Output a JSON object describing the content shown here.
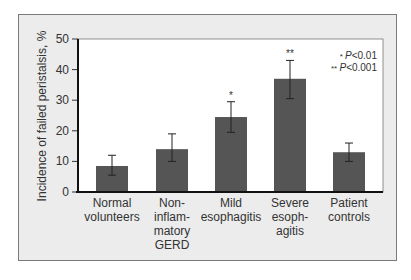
{
  "chart_data": {
    "type": "bar",
    "title": "",
    "xlabel": "",
    "ylabel": "Incidence of failed peristalsis, %",
    "ylim": [
      0,
      50
    ],
    "yticks": [
      0,
      10,
      20,
      30,
      40,
      50
    ],
    "grid": false,
    "categories": [
      "Normal volunteers",
      "Non-inflammatory GERD",
      "Mild esophagitis",
      "Severe esophagitis",
      "Patient controls"
    ],
    "category_label_lines": [
      [
        "Normal",
        "volunteers"
      ],
      [
        "Non-",
        "inflam-",
        "matory",
        "GERD"
      ],
      [
        "Mild",
        "esophagitis"
      ],
      [
        "Severe",
        "esoph-",
        "agitis"
      ],
      [
        "Patient",
        "controls"
      ]
    ],
    "values": [
      8.5,
      14,
      24.5,
      37,
      13
    ],
    "error_low": [
      5.5,
      10,
      19.5,
      30.5,
      10
    ],
    "error_high": [
      12,
      19,
      29.5,
      43,
      16
    ],
    "significance": [
      "",
      "",
      "*",
      "**",
      ""
    ],
    "legend": {
      "entries": [
        {
          "marker": "*",
          "text": "P<0.01"
        },
        {
          "marker": "**",
          "text": "P<0.001"
        }
      ],
      "position": "top-right"
    },
    "colors": {
      "bar": "#555555",
      "frame_bg": "#ececec",
      "plot_bg": "#ffffff",
      "axis": "#111111"
    }
  }
}
